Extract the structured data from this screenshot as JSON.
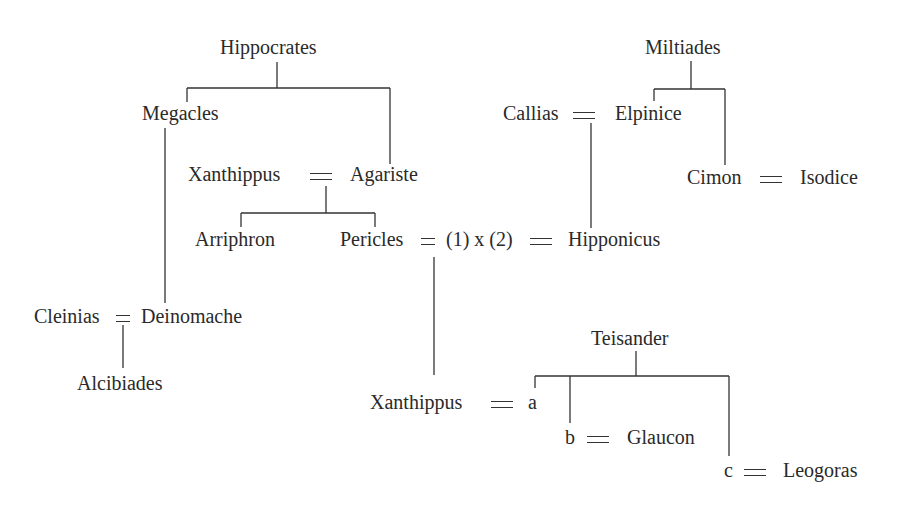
{
  "diagram": {
    "type": "family-tree",
    "people": {
      "hippocrates": "Hippocrates",
      "megacles": "Megacles",
      "xanthippus_elder": "Xanthippus",
      "agariste": "Agariste",
      "arriphron": "Arriphron",
      "pericles": "Pericles",
      "wife_marker": "(1) x (2)",
      "hipponicus": "Hipponicus",
      "callias": "Callias",
      "elpinice": "Elpinice",
      "miltiades": "Miltiades",
      "cimon": "Cimon",
      "isodice": "Isodice",
      "cleinias": "Cleinias",
      "deinomache": "Deinomache",
      "alcibiades": "Alcibiades",
      "xanthippus_younger": "Xanthippus",
      "a": "a",
      "teisander": "Teisander",
      "b": "b",
      "glaucon": "Glaucon",
      "c": "c",
      "leogoras": "Leogoras"
    },
    "marriage_symbol": "=",
    "relations": [
      {
        "parent": "Hippocrates",
        "children": [
          "Megacles",
          "Agariste"
        ]
      },
      {
        "couple": [
          "Xanthippus",
          "Agariste"
        ],
        "children": [
          "Arriphron",
          "Pericles"
        ]
      },
      {
        "parent": "Miltiades",
        "children": [
          "Elpinice",
          "Cimon"
        ]
      },
      {
        "couple": [
          "Callias",
          "Elpinice"
        ],
        "children": [
          "Hipponicus"
        ]
      },
      {
        "couple": [
          "Cimon",
          "Isodice"
        ]
      },
      {
        "couple": [
          "Pericles",
          "(1) x"
        ],
        "children": [
          "Xanthippus"
        ]
      },
      {
        "couple": [
          "x (2)",
          "Hipponicus"
        ]
      },
      {
        "couple": [
          "Cleinias",
          "Deinomache"
        ],
        "children": [
          "Alcibiades"
        ]
      },
      {
        "parent": "Megacles",
        "children": [
          "Deinomache"
        ]
      },
      {
        "parent": "Teisander",
        "children": [
          "a",
          "b",
          "c"
        ]
      },
      {
        "couple": [
          "Xanthippus",
          "a"
        ]
      },
      {
        "couple": [
          "b",
          "Glaucon"
        ]
      },
      {
        "couple": [
          "c",
          "Leogoras"
        ]
      }
    ]
  }
}
